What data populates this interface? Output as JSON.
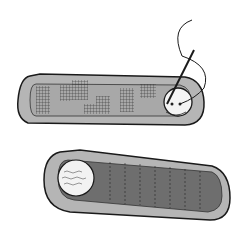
{
  "illustration": {
    "subject": "two sewn fabric pieces with button and needle",
    "colors": {
      "outline": "#1a1a1a",
      "border_fill": "#b5b5b5",
      "inner_fill_top": "#9a9a9a",
      "inner_fill_bottom": "#6e6e6e",
      "button": "#f4f4f4",
      "background": "#ffffff"
    }
  }
}
